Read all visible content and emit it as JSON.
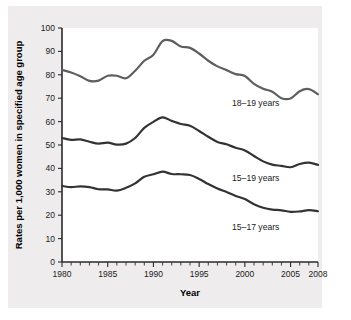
{
  "chart_data": {
    "type": "line",
    "title": "",
    "xlabel": "Year",
    "ylabel": "Rates per 1,000 women in specified age group",
    "xlim": [
      1980,
      2008
    ],
    "ylim": [
      0,
      100
    ],
    "grid": false,
    "legend_position": "inline-labels",
    "x": [
      1980,
      1981,
      1982,
      1983,
      1984,
      1985,
      1986,
      1987,
      1988,
      1989,
      1990,
      1991,
      1992,
      1993,
      1994,
      1995,
      1996,
      1997,
      1998,
      1999,
      2000,
      2001,
      2002,
      2003,
      2004,
      2005,
      2006,
      2007,
      2008
    ],
    "xticks": [
      1980,
      1985,
      1990,
      1995,
      2000,
      2005,
      2008
    ],
    "xtick_labels": [
      "1980",
      "1985",
      "1990",
      "1995",
      "2000",
      "2005",
      "2008"
    ],
    "yticks": [
      0,
      10,
      20,
      30,
      40,
      50,
      60,
      70,
      80,
      90,
      100
    ],
    "ytick_labels": [
      "0",
      "10",
      "20",
      "30",
      "40",
      "50",
      "60",
      "70",
      "80",
      "90",
      "100"
    ],
    "series": [
      {
        "name": "18–19 years",
        "color": "#5e5e5e",
        "label_x": 1998.6,
        "label_y": 66.5,
        "values": [
          82.1,
          81.0,
          79.4,
          77.4,
          77.5,
          79.6,
          79.6,
          78.5,
          81.7,
          86.0,
          88.6,
          94.4,
          94.5,
          92.1,
          91.5,
          89.1,
          86.0,
          83.6,
          82.0,
          80.3,
          79.5,
          76.1,
          74.0,
          72.8,
          70.0,
          69.9,
          73.0,
          73.9,
          71.7
        ]
      },
      {
        "name": "15–19 years",
        "color": "#333333",
        "label_x": 1998.6,
        "label_y": 34.8,
        "values": [
          53.0,
          52.2,
          52.4,
          51.4,
          50.6,
          51.0,
          50.2,
          50.6,
          53.0,
          57.3,
          59.9,
          61.8,
          60.3,
          59.0,
          58.2,
          56.0,
          53.5,
          51.3,
          50.3,
          48.8,
          47.7,
          45.3,
          43.0,
          41.6,
          41.1,
          40.5,
          41.9,
          42.5,
          41.5
        ]
      },
      {
        "name": "15–17 years",
        "color": "#333333",
        "label_x": 1998.6,
        "label_y": 13.5,
        "values": [
          32.5,
          32.0,
          32.3,
          32.0,
          31.1,
          31.0,
          30.5,
          31.7,
          33.6,
          36.4,
          37.5,
          38.6,
          37.6,
          37.5,
          37.2,
          35.5,
          33.3,
          31.4,
          29.9,
          28.2,
          26.9,
          24.7,
          23.2,
          22.4,
          22.1,
          21.4,
          21.6,
          22.2,
          21.7
        ]
      }
    ]
  }
}
